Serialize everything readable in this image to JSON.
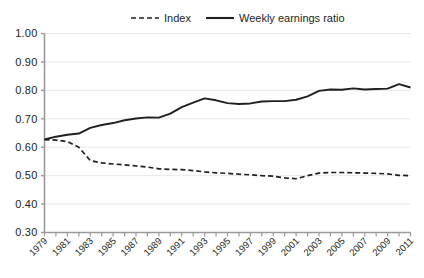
{
  "chart_data": {
    "type": "line",
    "title": "",
    "subtitle": "",
    "xlabel": "",
    "ylabel": "",
    "grid": true,
    "legend_position": "top",
    "xlim": [
      1979,
      2011
    ],
    "ylim": [
      0.3,
      1.0
    ],
    "yticks": [
      "1.00",
      "0.90",
      "0.80",
      "0.70",
      "0.60",
      "0.50",
      "0.40",
      "0.30"
    ],
    "ytick_values": [
      1.0,
      0.9,
      0.8,
      0.7,
      0.6,
      0.5,
      0.4,
      0.3
    ],
    "x": [
      1979,
      1980,
      1981,
      1982,
      1983,
      1984,
      1985,
      1986,
      1987,
      1988,
      1989,
      1990,
      1991,
      1992,
      1993,
      1994,
      1995,
      1996,
      1997,
      1998,
      1999,
      2000,
      2001,
      2002,
      2003,
      2004,
      2005,
      2006,
      2007,
      2008,
      2009,
      2010,
      2011
    ],
    "xtick_labels": [
      "1979",
      "1981",
      "1983",
      "1985",
      "1987",
      "1989",
      "1991",
      "1993",
      "1995",
      "1997",
      "1999",
      "2001",
      "2003",
      "2005",
      "2007",
      "2009",
      "2011"
    ],
    "xtick_label_values": [
      1979,
      1981,
      1983,
      1985,
      1987,
      1989,
      1991,
      1993,
      1995,
      1997,
      1999,
      2001,
      2003,
      2005,
      2007,
      2009,
      2011
    ],
    "series": [
      {
        "name": "Index",
        "style": "dashed",
        "color": "#231f20",
        "values": [
          0.627,
          0.625,
          0.62,
          0.6,
          0.553,
          0.545,
          0.541,
          0.538,
          0.534,
          0.53,
          0.524,
          0.522,
          0.521,
          0.518,
          0.513,
          0.51,
          0.508,
          0.505,
          0.503,
          0.5,
          0.498,
          0.492,
          0.489,
          0.5,
          0.509,
          0.511,
          0.511,
          0.51,
          0.509,
          0.508,
          0.506,
          0.501,
          0.5
        ]
      },
      {
        "name": "Weekly earnings ratio",
        "style": "solid",
        "color": "#231f20",
        "values": [
          0.627,
          0.637,
          0.644,
          0.648,
          0.668,
          0.678,
          0.685,
          0.695,
          0.701,
          0.705,
          0.704,
          0.718,
          0.741,
          0.757,
          0.772,
          0.765,
          0.755,
          0.752,
          0.754,
          0.761,
          0.762,
          0.762,
          0.767,
          0.779,
          0.798,
          0.803,
          0.802,
          0.807,
          0.803,
          0.805,
          0.806,
          0.822,
          0.81
        ]
      }
    ]
  },
  "legend": {
    "items": [
      {
        "label": "Index",
        "style": "dashed"
      },
      {
        "label": "Weekly earnings ratio",
        "style": "solid"
      }
    ]
  },
  "colors": {
    "line": "#231f20",
    "grid": "#e8e8e8",
    "axis": "#9a9a9a",
    "text": "#231f20",
    "background": "#ffffff"
  }
}
